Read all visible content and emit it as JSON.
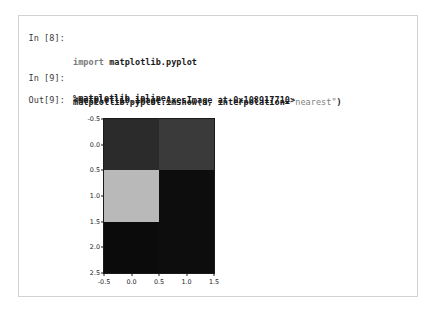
{
  "notebook": {
    "cells": [
      {
        "prompt": "In [8]:",
        "lines": [
          {
            "kw": "import",
            "rest": " matplotlib.pyplot"
          },
          {
            "magic": "%matplotlib inline"
          }
        ]
      },
      {
        "prompt": "In [9]:",
        "code_prefix": "matplotlib.pyplot.imshow(a, interpolation=",
        "code_string": "\"nearest\"",
        "code_suffix": ")"
      },
      {
        "prompt": "Out[9]:",
        "output_text": "<matplotlib.image.AxesImage at 0x108917710>"
      }
    ]
  },
  "chart_data": {
    "type": "heatmap",
    "title": "",
    "xlabel": "",
    "ylabel": "",
    "xlim": [
      -0.5,
      1.5
    ],
    "ylim": [
      2.5,
      -0.5
    ],
    "xticks": [
      "-0.5",
      "0.0",
      "0.5",
      "1.0",
      "1.5"
    ],
    "xtick_values": [
      -0.5,
      0.0,
      0.5,
      1.0,
      1.5
    ],
    "yticks": [
      "-0.5",
      "0.0",
      "0.5",
      "1.0",
      "1.5",
      "2.0",
      "2.5"
    ],
    "ytick_values": [
      -0.5,
      0.0,
      0.5,
      1.0,
      1.5,
      2.0,
      2.5
    ],
    "grid": false,
    "legend": false,
    "colormap": "gray",
    "rows": 3,
    "cols": 2,
    "cells": [
      {
        "row": 0,
        "col": 0,
        "color": "#2b2b2b",
        "value": 0.17
      },
      {
        "row": 0,
        "col": 1,
        "color": "#3a3a3a",
        "value": 0.23
      },
      {
        "row": 1,
        "col": 0,
        "color": "#b9b9b9",
        "value": 0.73
      },
      {
        "row": 1,
        "col": 1,
        "color": "#0d0d0d",
        "value": 0.05
      },
      {
        "row": 2,
        "col": 0,
        "color": "#0b0b0b",
        "value": 0.04
      },
      {
        "row": 2,
        "col": 1,
        "color": "#0d0d0d",
        "value": 0.05
      }
    ]
  },
  "colors": {
    "panel_border": "#d2d2d2",
    "axis": "#1a1a1a",
    "code_text": "#1a1a1a",
    "prompt_text": "#3a3a3a",
    "string_literal": "#808080",
    "keyword": "#7a7a7a",
    "background": "#ffffff"
  }
}
